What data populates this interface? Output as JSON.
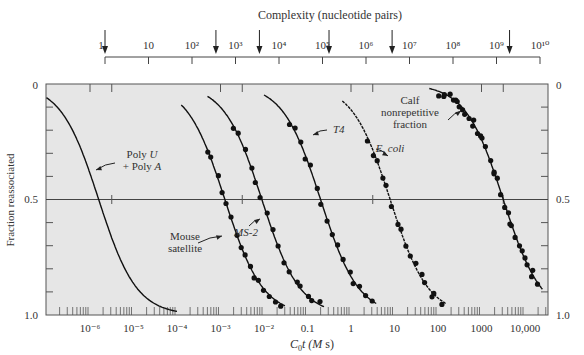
{
  "chart_data": {
    "type": "line",
    "title": "",
    "top_axis": {
      "label": "Complexity (nucleotide pairs)",
      "ticks": [
        "1",
        "10",
        "10^2",
        "10^3",
        "10^4",
        "10^5",
        "10^6",
        "10^7",
        "10^8",
        "10^9",
        "10^10"
      ],
      "tick_exponents": [
        0,
        1,
        2,
        3,
        4,
        5,
        6,
        7,
        8,
        9,
        10
      ],
      "arrow_positions_log10": [
        0,
        2.55,
        3.55,
        5.15,
        6.6,
        9.3
      ]
    },
    "xlabel": "C0t (M s)",
    "xscale": "log",
    "xlim_log10": [
      -6.9,
      4.5
    ],
    "x_ticks": [
      {
        "label": "10^-6",
        "log10": -6
      },
      {
        "label": "10^-5",
        "log10": -5
      },
      {
        "label": "10^-4",
        "log10": -4
      },
      {
        "label": "10^-3",
        "log10": -3
      },
      {
        "label": "10^-2",
        "log10": -2
      },
      {
        "label": "0.1",
        "log10": -1
      },
      {
        "label": "1",
        "log10": 0
      },
      {
        "label": "10",
        "log10": 1
      },
      {
        "label": "100",
        "log10": 2
      },
      {
        "label": "1000",
        "log10": 3
      },
      {
        "label": "10,000",
        "log10": 4
      }
    ],
    "ylabel": "Fraction reassociated",
    "ylim": [
      0,
      1.0
    ],
    "y_inverted": true,
    "y_ticks": [
      "0",
      "0.5",
      "1.0"
    ],
    "grid": "horizontal line at 0.5",
    "background": "#e6e6e6",
    "series": [
      {
        "name": "Poly U + Poly A",
        "label_lines": [
          "Poly U",
          "+ Poly A"
        ],
        "midpoint_log10_c0t": -5.8,
        "has_points": false
      },
      {
        "name": "Mouse satellite",
        "label_lines": [
          "Mouse",
          "satellite"
        ],
        "midpoint_log10_c0t": -2.9,
        "has_points": true
      },
      {
        "name": "MS-2",
        "label_lines": [
          "MS-2"
        ],
        "midpoint_log10_c0t": -2.05,
        "has_points": true
      },
      {
        "name": "T4",
        "label_lines": [
          "T4"
        ],
        "midpoint_log10_c0t": -0.7,
        "has_points": true
      },
      {
        "name": "E. coli",
        "label_lines": [
          "E. coli"
        ],
        "midpoint_log10_c0t": 0.9,
        "has_points": true
      },
      {
        "name": "Calf nonrepetitive fraction",
        "label_lines": [
          "Calf",
          "nonrepetitive",
          "fraction"
        ],
        "midpoint_log10_c0t": 3.5,
        "has_points": true
      }
    ]
  },
  "text": {
    "top_axis_label": "Complexity (nucleotide pairs)",
    "y_axis_label": "Fraction reassociated",
    "x_axis_label_c": "C",
    "x_axis_label_sub": "0",
    "x_axis_label_t": "t (",
    "x_axis_label_m": "M",
    "x_axis_label_s": " s)",
    "y_left_0": "0",
    "y_left_05": "0.5",
    "y_left_10": "1.0",
    "y_right_0": "0",
    "y_right_05": "0.5",
    "y_right_10": "1.0"
  }
}
